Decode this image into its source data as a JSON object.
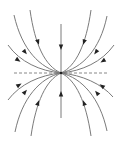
{
  "diagram": {
    "type": "phase-portrait",
    "background": "#ffffff",
    "line_color": "#7a7a7a",
    "arrow_color": "#222222",
    "origin": [
      61,
      73
    ],
    "dashed_axis": {
      "x1": 14,
      "y1": 73,
      "x2": 108,
      "y2": 73
    },
    "vertical_axis": {
      "x": 61,
      "y_top": 24,
      "y_bottom": 118,
      "arrows": [
        {
          "x": 61,
          "y": 47,
          "dir": "down"
        },
        {
          "x": 61,
          "y": 94,
          "dir": "up"
        }
      ]
    },
    "trajectories": [
      {
        "d": "M14 15 C 22 50, 40 68, 61 73",
        "arrow": [
          25,
          52,
          60
        ]
      },
      {
        "d": "M30 10 C 35 45, 45 66, 61 73",
        "arrow": [
          38,
          42,
          70
        ]
      },
      {
        "d": "M8 45 C 20 62, 40 71, 61 73",
        "arrow": [
          18,
          60,
          38
        ]
      },
      {
        "d": "M91 10 C 86 45, 76 66, 61 73",
        "arrow": [
          84,
          42,
          110
        ]
      },
      {
        "d": "M107 16 C 100 50, 82 68, 61 73",
        "arrow": [
          96,
          52,
          120
        ]
      },
      {
        "d": "M114 45 C 102 62, 82 71, 61 73",
        "arrow": [
          103,
          61,
          142
        ]
      },
      {
        "d": "M8 100 C 20 84, 40 75, 61 73",
        "arrow": [
          19,
          85,
          -38
        ]
      },
      {
        "d": "M15 132 C 22 98, 40 78, 61 73",
        "arrow": [
          25,
          92,
          -60
        ]
      },
      {
        "d": "M31 136 C 36 102, 46 80, 61 73",
        "arrow": [
          38,
          103,
          -70
        ]
      },
      {
        "d": "M91 136 C 86 102, 76 80, 61 73",
        "arrow": [
          84,
          103,
          -110
        ]
      },
      {
        "d": "M107 131 C 100 98, 82 78, 61 73",
        "arrow": [
          97,
          93,
          -120
        ]
      },
      {
        "d": "M113 97 C 102 84, 82 75, 61 73",
        "arrow": [
          102,
          86,
          -142
        ]
      }
    ]
  }
}
